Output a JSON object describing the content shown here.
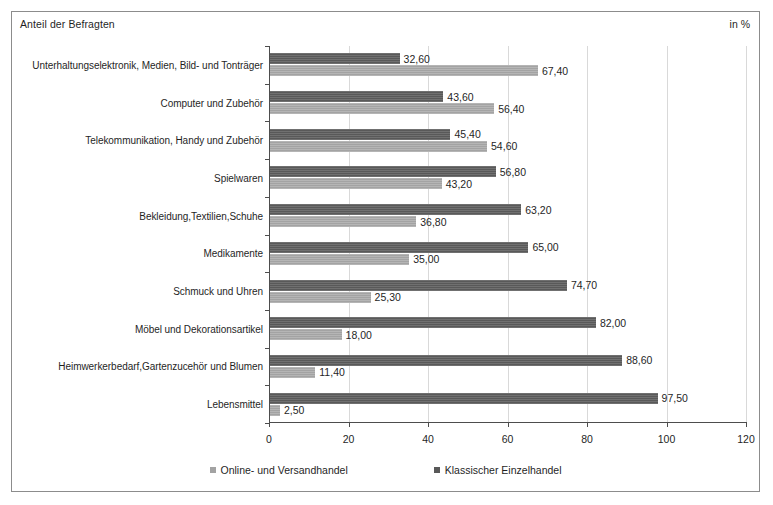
{
  "header": {
    "left_title": "Anteil der Befragten",
    "right_unit": "in %"
  },
  "legend": {
    "position": "bottom-center",
    "items": [
      {
        "label": "Online- und Versandhandel",
        "color": "#a3a3a3",
        "key": "online"
      },
      {
        "label": "Klassischer Einzelhandel",
        "color": "#595959",
        "key": "classic"
      }
    ]
  },
  "chart_data": {
    "type": "bar",
    "orientation": "horizontal",
    "title": "Anteil der Befragten",
    "subtitle": "",
    "xlabel": "",
    "ylabel": "",
    "unit": "in %",
    "xlim": [
      0,
      120
    ],
    "xticks": [
      0,
      20,
      40,
      60,
      80,
      100,
      120
    ],
    "xtick_labels": [
      "0",
      "20",
      "40",
      "60",
      "80",
      "100",
      "120"
    ],
    "grid": true,
    "grid_axis": "x",
    "legend_position": "bottom-center",
    "decimal_separator": ",",
    "categories": [
      "Unterhaltungselektronik, Medien, Bild- und Tonträger",
      "Computer und Zubehör",
      "Telekommunikation, Handy und Zubehör",
      "Spielwaren",
      "Bekleidung,Textilien,Schuhe",
      "Medikamente",
      "Schmuck und Uhren",
      "Möbel und Dekorationsartikel",
      "Heimwerkerbedarf,Gartenzucehör und Blumen",
      "Lebensmittel"
    ],
    "series": [
      {
        "name": "Klassischer Einzelhandel",
        "key": "classic",
        "color": "#595959",
        "values": [
          32.6,
          43.6,
          45.4,
          56.8,
          63.2,
          65.0,
          74.7,
          82.0,
          88.6,
          97.5
        ],
        "labels": [
          "32,60",
          "43,60",
          "45,40",
          "56,80",
          "63,20",
          "65,00",
          "74,70",
          "82,00",
          "88,60",
          "97,50"
        ]
      },
      {
        "name": "Online- und Versandhandel",
        "key": "online",
        "color": "#a3a3a3",
        "values": [
          67.4,
          56.4,
          54.6,
          43.2,
          36.8,
          35.0,
          25.3,
          18.0,
          11.4,
          2.5
        ],
        "labels": [
          "67,40",
          "56,40",
          "54,60",
          "43,20",
          "36,80",
          "35,00",
          "25,30",
          "18,00",
          "11,40",
          "2,50"
        ]
      }
    ]
  }
}
